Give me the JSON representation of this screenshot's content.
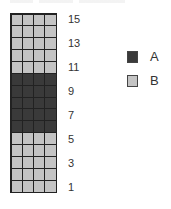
{
  "diagram": {
    "rows": 15,
    "columns": 4,
    "row_labels": [
      "15",
      "13",
      "11",
      "9",
      "7",
      "5",
      "3",
      "1"
    ],
    "row_label_values": [
      15,
      13,
      11,
      9,
      7,
      5,
      3,
      1
    ],
    "row_categories_top_to_bottom": [
      "B",
      "B",
      "B",
      "B",
      "B",
      "A",
      "A",
      "A",
      "A",
      "A",
      "B",
      "B",
      "B",
      "B",
      "B"
    ]
  },
  "legend": {
    "items": [
      {
        "label": "A",
        "color": "#3a3a3a"
      },
      {
        "label": "B",
        "color": "#c4c4c4"
      }
    ]
  },
  "colors": {
    "A": "#3a3a3a",
    "B": "#c4c4c4",
    "grid_line": "#222222"
  }
}
